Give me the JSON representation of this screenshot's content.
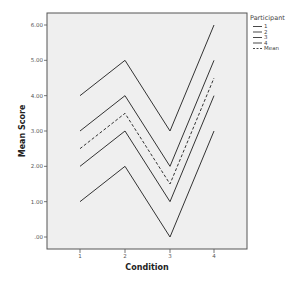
{
  "chart_data": {
    "type": "line",
    "title": "",
    "xlabel": "Condition",
    "ylabel": "Mean Score",
    "categories": [
      "1",
      "2",
      "3",
      "4"
    ],
    "x": [
      1,
      2,
      3,
      4
    ],
    "yticks": [
      ".00",
      "1.00",
      "2.00",
      "3.00",
      "4.00",
      "5.00",
      "6.00"
    ],
    "ylim": [
      0,
      6
    ],
    "grid": false,
    "legend": {
      "title": "Participant",
      "position": "right-top",
      "entries": [
        "1",
        "2",
        "3",
        "4",
        "Mean"
      ]
    },
    "series": [
      {
        "name": "1",
        "values": [
          4,
          5,
          3,
          6
        ],
        "style": "solid"
      },
      {
        "name": "2",
        "values": [
          3,
          4,
          2,
          5
        ],
        "style": "solid"
      },
      {
        "name": "3",
        "values": [
          2,
          3,
          1,
          4
        ],
        "style": "solid"
      },
      {
        "name": "4",
        "values": [
          1,
          2,
          0,
          3
        ],
        "style": "solid"
      },
      {
        "name": "Mean",
        "values": [
          2.5,
          3.5,
          1.5,
          4.5
        ],
        "style": "dashed"
      }
    ]
  },
  "colors": {
    "plot_background": "#efefef",
    "frame": "#555555",
    "line": "#333333"
  }
}
